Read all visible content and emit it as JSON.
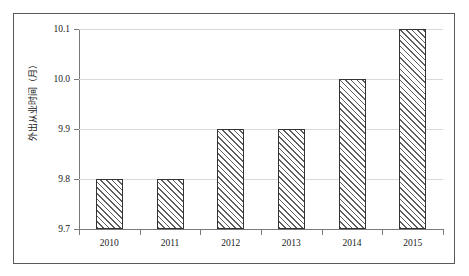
{
  "chart_data": {
    "type": "bar",
    "title": "",
    "subtitle": "",
    "xlabel": "",
    "ylabel": "外出从业时间（月）",
    "categories": [
      "2010",
      "2011",
      "2012",
      "2013",
      "2014",
      "2015"
    ],
    "values": [
      9.8,
      9.8,
      9.9,
      9.9,
      10.0,
      10.1
    ],
    "series": [
      {
        "name": "外出从业时间（月）",
        "values": [
          9.8,
          9.8,
          9.9,
          9.9,
          10.0,
          10.1
        ]
      }
    ],
    "ylim": [
      9.7,
      10.1
    ],
    "ytick_labels": [
      "9.7",
      "9.8",
      "9.9",
      "10.0",
      "10.1"
    ],
    "ytick_values": [
      9.7,
      9.8,
      9.9,
      10.0,
      10.1
    ],
    "grid": "horizontal",
    "legend": "none",
    "bar_fill": "diagonal-hatch",
    "bar_border_color": "#333333",
    "gridline_color": "#d9d9d9",
    "axis_color": "#7a7a7a",
    "frame_color": "#5a5a5a",
    "background": "#ffffff"
  }
}
